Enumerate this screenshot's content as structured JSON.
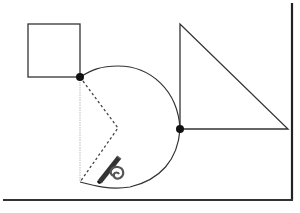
{
  "diagram": {
    "title": "",
    "colors": {
      "background": "#ffffff",
      "stroke": "#333333",
      "frame": "#222222",
      "dashed": "#444444",
      "guide": "#bbbbbb",
      "dot": "#111111"
    },
    "shapes": {
      "square": {
        "x": 28,
        "y": 24,
        "w": 52,
        "h": 53
      },
      "triangle": {
        "apex": [
          180,
          24
        ],
        "base_left": [
          180,
          129
        ],
        "base_right": [
          288,
          129
        ]
      },
      "arc_shape": {
        "start": [
          80,
          77
        ],
        "end": [
          180,
          129
        ],
        "bottom": [
          80,
          182
        ]
      },
      "dotted_v": {
        "top": [
          80,
          77
        ],
        "apex": [
          118,
          128
        ],
        "bottom": [
          80,
          182
        ]
      },
      "dots": [
        [
          80,
          77
        ],
        [
          180,
          129
        ]
      ]
    },
    "icons": [
      "pencil-icon",
      "spiral-icon"
    ],
    "frame": {
      "right_x": 292,
      "bottom_y": 200
    }
  }
}
